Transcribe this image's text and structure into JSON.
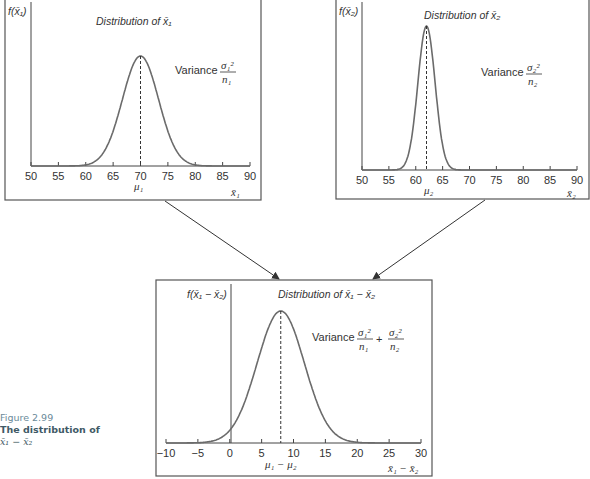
{
  "caption": {
    "figure_number": "Figure 2.99",
    "title": "The distribution of",
    "expression": "x̄₁ − x̄₂"
  },
  "colors": {
    "curve": "#6b6b6b",
    "axis": "#444444",
    "frame": "#555555",
    "caption_accent": "#3f5a66"
  },
  "panels": {
    "p1": {
      "ylabel": "f(x̄₁)",
      "title": "Distribution of x̄₁",
      "variance_label": "Variance",
      "variance_num": "σ₁²",
      "variance_den": "n₁",
      "mean_label": "μ₁",
      "xlabel": "x̄₁"
    },
    "p2": {
      "ylabel": "f(x̄₂)",
      "title": "Distribution of x̄₂",
      "variance_label": "Variance",
      "variance_num": "σ₂²",
      "variance_den": "n₂",
      "mean_label": "μ₂",
      "xlabel": "x̄₂"
    },
    "p3": {
      "ylabel": "f(x̄₁ − x̄₂)",
      "title": "Distribution of x̄₁ − x̄₂",
      "variance_label": "Variance",
      "variance_num1": "σ₁²",
      "variance_den1": "n₁",
      "plus": "+",
      "variance_num2": "σ₂²",
      "variance_den2": "n₂",
      "mean_label": "μ₁ − μ₂",
      "xlabel": "x̄₁ − x̄₂"
    }
  },
  "chart_data": [
    {
      "type": "line",
      "title": "Distribution of x̄₁",
      "xlabel": "x̄₁",
      "ylabel": "f(x̄₁)",
      "xlim": [
        50,
        90
      ],
      "xticks": [
        50,
        55,
        60,
        65,
        70,
        75,
        80,
        85,
        90
      ],
      "curve": "normal",
      "mean": 70,
      "sd": 3.3,
      "mean_marker": "μ₁",
      "annotation": "Variance σ₁²/n₁",
      "grid": false
    },
    {
      "type": "line",
      "title": "Distribution of x̄₂",
      "xlabel": "x̄₂",
      "ylabel": "f(x̄₂)",
      "xlim": [
        50,
        90
      ],
      "xticks": [
        50,
        55,
        60,
        65,
        70,
        75,
        80,
        85,
        90
      ],
      "curve": "normal",
      "mean": 62,
      "sd": 1.6,
      "mean_marker": "μ₂",
      "annotation": "Variance σ₂²/n₂",
      "grid": false
    },
    {
      "type": "line",
      "title": "Distribution of x̄₁ − x̄₂",
      "xlabel": "x̄₁ − x̄₂",
      "ylabel": "f(x̄₁ − x̄₂)",
      "xlim": [
        -10,
        30
      ],
      "xticks": [
        -10,
        -5,
        0,
        5,
        10,
        15,
        20,
        25,
        30
      ],
      "curve": "normal",
      "mean": 8,
      "sd": 3.7,
      "mean_marker": "μ₁ − μ₂",
      "annotation": "Variance σ₁²/n₁ + σ₂²/n₂",
      "grid": false
    }
  ]
}
